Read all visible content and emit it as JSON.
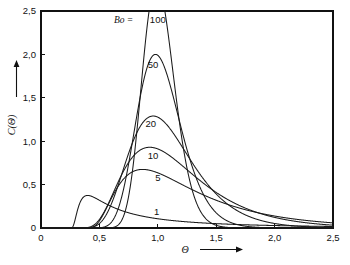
{
  "chart_data": {
    "type": "line",
    "title": "",
    "xlabel": "Θ",
    "ylabel": "C(Θ)",
    "xlim": [
      0,
      2.5
    ],
    "ylim": [
      0,
      2.5
    ],
    "grid": false,
    "legend_position": "inline-curve-labels",
    "legend_prefix": "Bo =",
    "x_ticks": [
      {
        "value": 0,
        "label": "0"
      },
      {
        "value": 0.5,
        "label": "0,5"
      },
      {
        "value": 1.0,
        "label": "1,0"
      },
      {
        "value": 1.5,
        "label": "1,5"
      },
      {
        "value": 2.0,
        "label": "2,0"
      },
      {
        "value": 2.5,
        "label": "2,5"
      }
    ],
    "y_ticks": [
      {
        "value": 0,
        "label": "0"
      },
      {
        "value": 0.5,
        "label": "0,5"
      },
      {
        "value": 1.0,
        "label": "1,0"
      },
      {
        "value": 1.5,
        "label": "1,5"
      },
      {
        "value": 2.0,
        "label": "2,0"
      },
      {
        "value": 2.5,
        "label": "2,5"
      }
    ],
    "series": [
      {
        "name": "100",
        "bo": 100,
        "label": "100",
        "label_x": 1.0,
        "label_y": 2.36,
        "peak": {
          "x": 0.99,
          "y": 2.82
        },
        "clipped_top": true
      },
      {
        "name": "50",
        "bo": 50,
        "label": "50",
        "label_x": 0.96,
        "label_y": 1.84,
        "peak": {
          "x": 0.98,
          "y": 2.0
        },
        "clipped_top": false
      },
      {
        "name": "20",
        "bo": 20,
        "label": "20",
        "label_x": 0.94,
        "label_y": 1.16,
        "peak": {
          "x": 0.96,
          "y": 1.29
        },
        "clipped_top": false
      },
      {
        "name": "10",
        "bo": 10,
        "label": "10",
        "label_x": 0.96,
        "label_y": 0.8,
        "peak": {
          "x": 0.93,
          "y": 0.93
        },
        "clipped_top": false
      },
      {
        "name": "5",
        "bo": 5,
        "label": "5",
        "label_x": 1.0,
        "label_y": 0.545,
        "peak": {
          "x": 0.87,
          "y": 0.675
        },
        "clipped_top": false
      },
      {
        "name": "1",
        "bo": 1,
        "label": "1",
        "label_x": 0.99,
        "label_y": 0.155,
        "peak": {
          "x": 0.4,
          "y": 0.375
        },
        "clipped_top": false
      }
    ],
    "annotations": [
      {
        "name": "bo-prefix",
        "text": "Bo =",
        "x": 0.79,
        "y": 2.36
      }
    ]
  },
  "axes": {
    "x_axis_title": "Θ",
    "y_axis_title": "C(Θ)",
    "x_arrow": true,
    "y_arrow": true
  }
}
